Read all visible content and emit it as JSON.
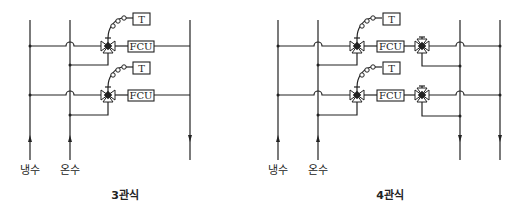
{
  "diagrams": [
    {
      "title": "3관식",
      "supply_labels": [
        "냉수",
        "온수"
      ],
      "units": [
        {
          "thermostat": "T",
          "unit": "FCU"
        },
        {
          "thermostat": "T",
          "unit": "FCU"
        }
      ]
    },
    {
      "title": "4관식",
      "supply_labels": [
        "냉수",
        "온수"
      ],
      "units": [
        {
          "thermostat": "T",
          "unit": "FCU"
        },
        {
          "thermostat": "T",
          "unit": "FCU"
        }
      ]
    }
  ]
}
